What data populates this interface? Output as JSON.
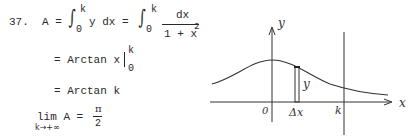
{
  "problem": {
    "number": "37.",
    "line1": {
      "lhs": "A =",
      "int1_upper": "k",
      "int1_lower": "0",
      "integrand1": "y dx =",
      "int2_upper": "k",
      "int2_lower": "0",
      "numerator": "dx",
      "denominator": "1 + x",
      "denominator_exp": "2"
    },
    "line2": {
      "expr": "= Arctan x",
      "upper": "k",
      "lower": "0"
    },
    "line3": {
      "expr": "= Arctan k"
    },
    "line4": {
      "lim": "lim A =",
      "subscript": "k→+∞",
      "numerator": "π",
      "denominator": "2"
    }
  },
  "figure": {
    "y_axis_label": "y",
    "x_axis_label": "x",
    "origin_label": "0",
    "strip_width_label": "Δx",
    "strip_height_label": "y",
    "k_label": "k"
  }
}
